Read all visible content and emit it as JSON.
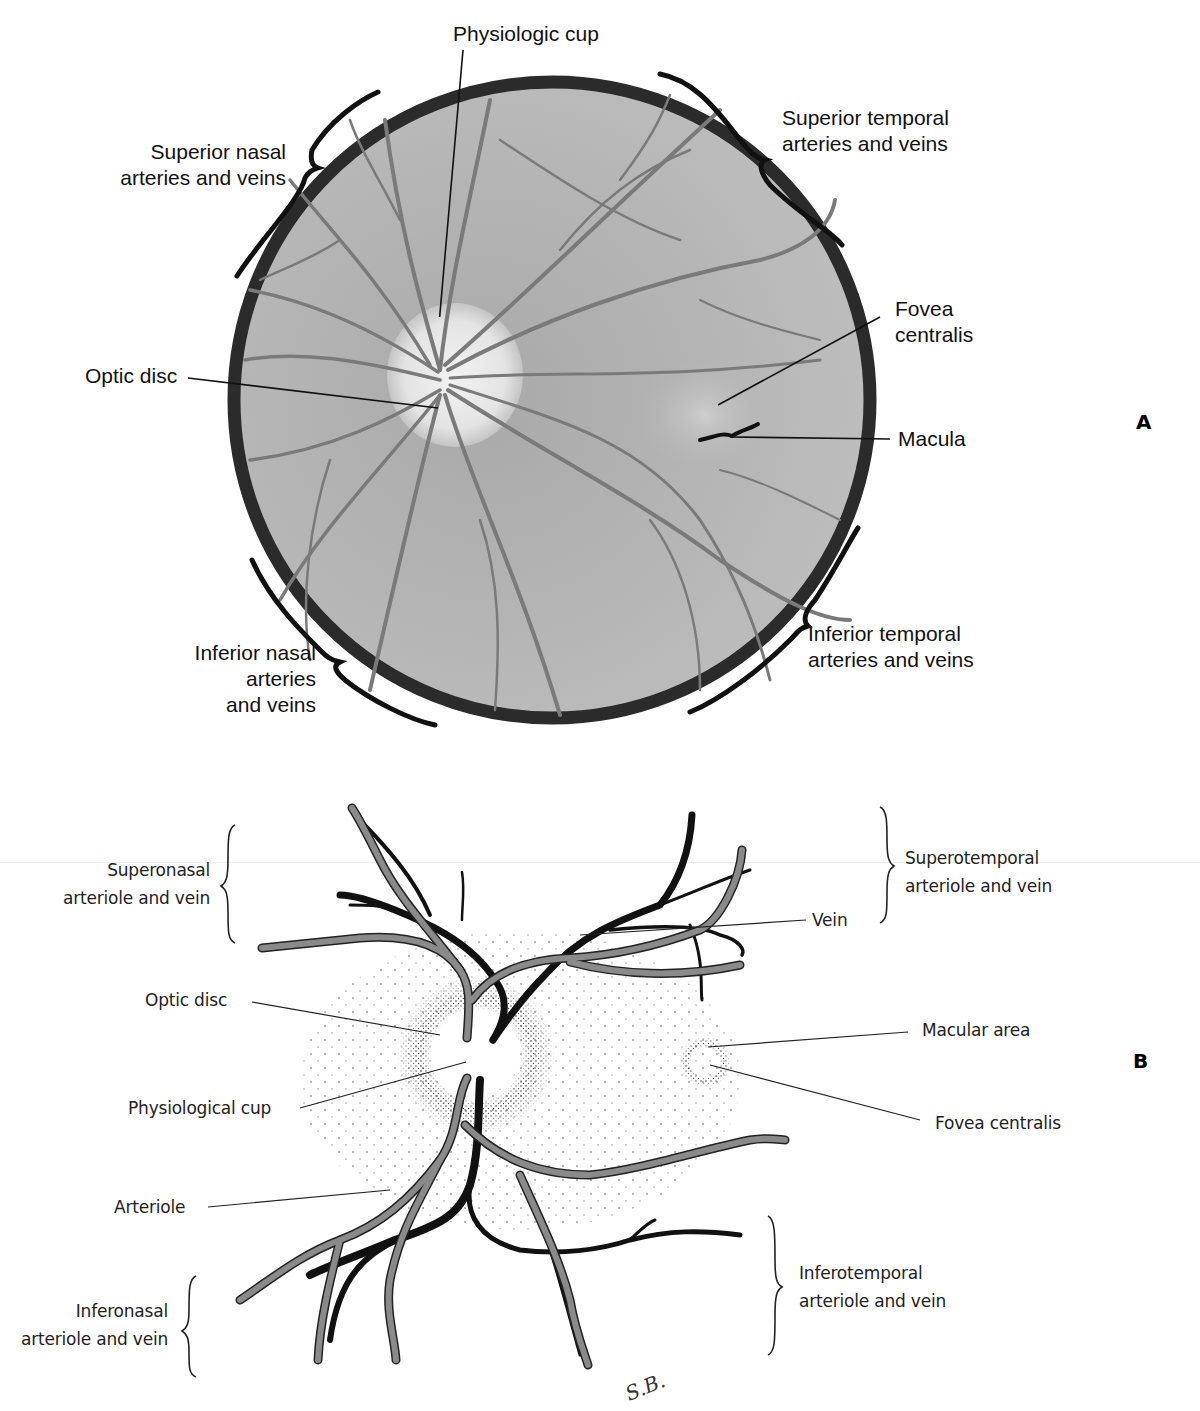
{
  "figure_a": {
    "panel_letter": "A",
    "labels": {
      "physiologic_cup": "Physiologic cup",
      "superior_nasal": [
        "Superior nasal",
        "arteries and veins"
      ],
      "superior_temporal": [
        "Superior temporal",
        "arteries and veins"
      ],
      "fovea_centralis": [
        "Fovea",
        "centralis"
      ],
      "optic_disc": "Optic disc",
      "macula": "Macula",
      "inferior_nasal": [
        "Inferior nasal",
        "arteries",
        "and veins"
      ],
      "inferior_temporal": [
        "Inferior temporal",
        "arteries and veins"
      ]
    },
    "colors": {
      "rim": "#2b2b2b",
      "fundus": "#b4b4b4",
      "vessel": "#7a7a7a",
      "disc": "#e6e6e6"
    }
  },
  "figure_b": {
    "panel_letter": "B",
    "labels": {
      "superonasal": [
        "Superonasal",
        "arteriole and vein"
      ],
      "superotemporal": [
        "Superotemporal",
        "arteriole and vein"
      ],
      "vein": "Vein",
      "optic_disc": "Optic disc",
      "macular_area": "Macular area",
      "physiological_cup": "Physiological cup",
      "fovea_centralis": "Fovea centralis",
      "arteriole": "Arteriole",
      "inferotemporal": [
        "Inferotemporal",
        "arteriole and vein"
      ],
      "inferonasal": [
        "Inferonasal",
        "arteriole and vein"
      ]
    },
    "signature": "S.B.",
    "colors": {
      "artery": "#8a8a8a",
      "vein": "#111111"
    }
  }
}
